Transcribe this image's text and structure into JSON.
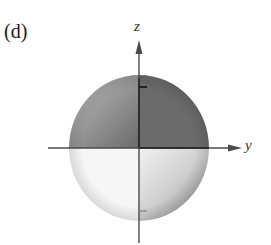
{
  "figure": {
    "panel_label": "(d)",
    "axes": {
      "vertical_label": "z",
      "horizontal_label": "y"
    },
    "colors": {
      "dark_lobe": "#6e6e6e",
      "light_lobe": "#f4f4f4",
      "axis": "#4a4a4a",
      "tick": "#222222"
    },
    "shape": "sphere with shaded lobes (dark upper-right, light lower-left)"
  }
}
